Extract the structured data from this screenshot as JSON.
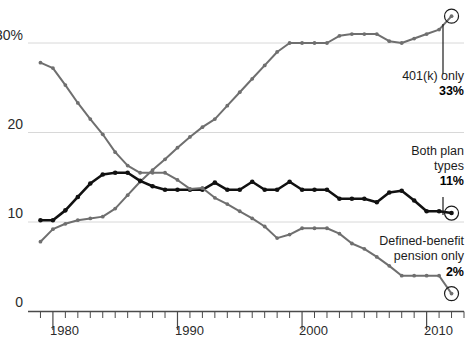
{
  "chart_data": {
    "type": "line",
    "title": "",
    "subtitle": "",
    "xlabel": "",
    "ylabel": "",
    "xlim": [
      1978,
      2013
    ],
    "ylim": [
      0,
      32
    ],
    "grid": true,
    "grid_axis": "y",
    "legend_position": "right-annotations",
    "y_ticks": [
      {
        "value": 0,
        "label": "0"
      },
      {
        "value": 10,
        "label": "10"
      },
      {
        "value": 20,
        "label": "20"
      },
      {
        "value": 30,
        "label": "30%"
      }
    ],
    "x_ticks_major": [
      {
        "value": 1980,
        "label": "1980"
      },
      {
        "value": 1990,
        "label": "1990"
      },
      {
        "value": 2000,
        "label": "2000"
      },
      {
        "value": 2010,
        "label": "2010"
      }
    ],
    "x_minor_tick_interval": 1,
    "x": [
      1979,
      1980,
      1981,
      1982,
      1983,
      1984,
      1985,
      1986,
      1987,
      1988,
      1989,
      1990,
      1991,
      1992,
      1993,
      1994,
      1995,
      1996,
      1997,
      1998,
      1999,
      2000,
      2001,
      2002,
      2003,
      2004,
      2005,
      2006,
      2007,
      2008,
      2009,
      2010,
      2011,
      2012
    ],
    "series": [
      {
        "name": "401(k) only",
        "color": "#6f6f6f",
        "end_value": 33,
        "end_label": "33%",
        "values": [
          7.8,
          9.2,
          9.8,
          10.2,
          10.4,
          10.6,
          11.5,
          13.0,
          14.5,
          15.8,
          17.0,
          18.3,
          19.5,
          20.6,
          21.5,
          23.0,
          24.5,
          26.0,
          27.5,
          29.0,
          30.0,
          30.0,
          30.0,
          30.0,
          30.8,
          31.0,
          31.0,
          31.0,
          30.2,
          30.0,
          30.5,
          31.0,
          31.5,
          33.0
        ]
      },
      {
        "name": "Both plan types",
        "color": "#111111",
        "end_value": 11,
        "end_label": "11%",
        "values": [
          10.2,
          10.2,
          11.3,
          12.8,
          14.3,
          15.3,
          15.5,
          15.5,
          14.6,
          14.0,
          13.6,
          13.6,
          13.6,
          13.6,
          14.4,
          13.6,
          13.6,
          14.5,
          13.6,
          13.6,
          14.5,
          13.6,
          13.6,
          13.6,
          12.6,
          12.6,
          12.6,
          12.2,
          13.3,
          13.5,
          12.4,
          11.2,
          11.2,
          11.0
        ]
      },
      {
        "name": "Defined-benefit pension only",
        "color": "#6f6f6f",
        "end_value": 2,
        "end_label": "2%",
        "values": [
          27.8,
          27.2,
          25.3,
          23.3,
          21.5,
          19.8,
          17.8,
          16.3,
          15.5,
          15.5,
          15.5,
          14.7,
          13.7,
          13.8,
          12.7,
          12.0,
          11.2,
          10.4,
          9.5,
          8.2,
          8.6,
          9.3,
          9.3,
          9.3,
          8.7,
          7.6,
          7.0,
          6.1,
          5.1,
          4.0,
          4.0,
          4.0,
          4.0,
          2.0
        ]
      }
    ],
    "annotations": [
      {
        "id": "annotation-401k",
        "lines": [
          "401(k) only"
        ],
        "value": "33%",
        "target_x": 2012,
        "target_y": 33
      },
      {
        "id": "annotation-both-plans",
        "lines": [
          "Both plan",
          "types"
        ],
        "value": "11%",
        "target_x": 2012,
        "target_y": 11
      },
      {
        "id": "annotation-defined-benefit",
        "lines": [
          "Defined-benefit",
          "pension only"
        ],
        "value": "2%",
        "target_x": 2012,
        "target_y": 2
      }
    ]
  },
  "colors": {
    "gray_series": "#6f6f6f",
    "black_series": "#111111",
    "gridline": "#d8d8d8",
    "axis": "#4a4a4a",
    "text": "#1c1c1c",
    "background": "#ffffff"
  }
}
